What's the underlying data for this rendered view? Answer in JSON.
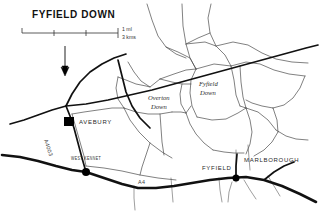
{
  "map": {
    "title": "FYFIELD DOWN",
    "scale": {
      "label_miles": "1 ml",
      "label_kms": "3 kms",
      "tick_count": 4
    },
    "north_arrow": {
      "name": "north-arrow",
      "label": "N"
    },
    "places": [
      {
        "id": "avebury",
        "name": "AVEBURY",
        "type": "settlement",
        "x": 80,
        "y": 122,
        "marker": "square"
      },
      {
        "id": "west-kennet",
        "name": "WEST KENNET",
        "type": "settlement",
        "x": 78,
        "y": 161,
        "marker": "dot"
      },
      {
        "id": "fyfield",
        "name": "FYFIELD",
        "type": "settlement",
        "x": 210,
        "y": 170,
        "marker": "none"
      },
      {
        "id": "marlborough",
        "name": "MARLBOROUGH",
        "type": "settlement",
        "x": 248,
        "y": 162,
        "marker": "none"
      },
      {
        "id": "overton-down",
        "name": "Overton\nDown",
        "type": "downland",
        "x": 150,
        "y": 101,
        "marker": "none"
      },
      {
        "id": "fyfield-down",
        "name": "Fyfield\nDown",
        "type": "downland",
        "x": 203,
        "y": 86,
        "marker": "none"
      }
    ],
    "place_lines": {
      "overton_down_1": "Overton",
      "overton_down_2": "Down",
      "fyfield_down_1": "Fyfield",
      "fyfield_down_2": "Down"
    },
    "roads": [
      {
        "id": "a4",
        "number": "A4",
        "class": "main"
      },
      {
        "id": "a4003",
        "number": "A4003",
        "class": "secondary"
      }
    ],
    "colors": {
      "ink": "#111111",
      "boundary": "#4a4a4a",
      "paper": "#ffffff",
      "label": "#2a2a2a"
    }
  }
}
